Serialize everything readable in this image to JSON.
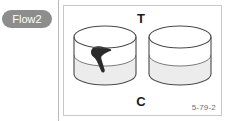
{
  "badge": {
    "label": "Flow2",
    "background_color": "#8d8d8d",
    "text_color": "#ffffff"
  },
  "panel": {
    "border_color": "#c9c9c9",
    "background_color": "#ffffff",
    "top_label": "T",
    "bottom_label": "C",
    "figure_code": "5-79-2",
    "figure_code_color": "#6d6d6d"
  },
  "illustration": {
    "type": "line-art-diagram",
    "description": "two open cylindrical containers",
    "stroke_color": "#4a4a4a",
    "liquid_color": "#ececec",
    "silhouette_color": "#2b2b2b",
    "containers": [
      {
        "name": "left-beaker",
        "filled": true,
        "contains_object": true,
        "object": "dark bird silhouette"
      },
      {
        "name": "right-beaker",
        "filled": true,
        "contains_object": false,
        "object": ""
      }
    ]
  },
  "divider": {
    "color": "#b9b9b9"
  }
}
